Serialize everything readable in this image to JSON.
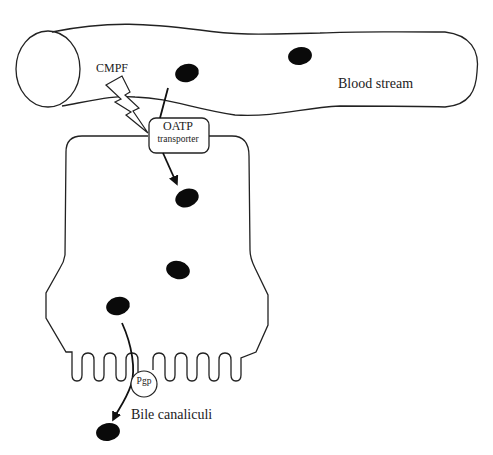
{
  "diagram": {
    "labels": {
      "cmpf": "CMPF",
      "blood_stream": "Blood stream",
      "oatp_line1": "OATP",
      "oatp_line2": "transporter",
      "pgp": "Pgp",
      "bile_canaliculi": "Bile canaliculi"
    },
    "nodes": [
      {
        "id": "blood-vessel",
        "type": "tube",
        "label": "Blood stream"
      },
      {
        "id": "cmpf-lightning",
        "type": "lightning-bolt",
        "label": "CMPF"
      },
      {
        "id": "oatp",
        "type": "rounded-rect",
        "label": "OATP transporter"
      },
      {
        "id": "hepatocyte",
        "type": "cell-outline",
        "label": ""
      },
      {
        "id": "pgp",
        "type": "circle",
        "label": "Pgp"
      },
      {
        "id": "bile-canaliculi",
        "type": "region",
        "label": "Bile canaliculi"
      }
    ],
    "molecules": [
      {
        "location": "blood-stream",
        "cx": 187,
        "cy": 73
      },
      {
        "location": "blood-stream",
        "cx": 300,
        "cy": 56
      },
      {
        "location": "cell",
        "cx": 187,
        "cy": 198
      },
      {
        "location": "cell",
        "cx": 178,
        "cy": 270
      },
      {
        "location": "cell",
        "cx": 118,
        "cy": 306
      },
      {
        "location": "bile",
        "cx": 108,
        "cy": 432
      }
    ],
    "edges": [
      {
        "from": "blood-stream-molecule",
        "to": "oatp",
        "style": "line"
      },
      {
        "from": "oatp",
        "to": "cell-molecule",
        "style": "arrow"
      },
      {
        "from": "cell-molecule",
        "to": "bile-molecule",
        "via": "pgp",
        "style": "arrow"
      },
      {
        "from": "cmpf-lightning",
        "to": "oatp",
        "style": "inhibits"
      }
    ],
    "colors": {
      "stroke": "#222222",
      "molecule": "#0a0a0a",
      "background": "#ffffff"
    }
  }
}
